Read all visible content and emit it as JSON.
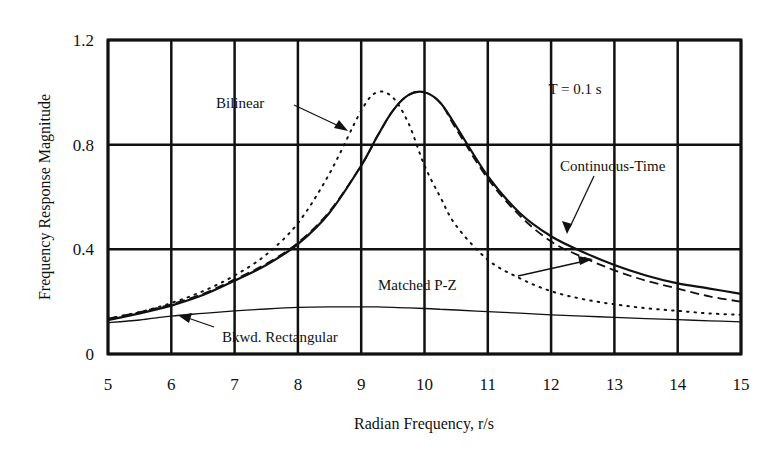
{
  "chart_data": {
    "type": "line",
    "title": "",
    "xlabel": "Radian Frequency, r/s",
    "ylabel": "Frequency Response Magnitude",
    "xlim": [
      5,
      15
    ],
    "ylim": [
      0,
      1.2
    ],
    "xticks": [
      "5",
      "6",
      "7",
      "8",
      "9",
      "10",
      "11",
      "12",
      "13",
      "14",
      "15"
    ],
    "yticks": [
      "0",
      "0.4",
      "0.8",
      "1.2"
    ],
    "grid": true,
    "legend": "annotations with arrows",
    "annotation_text": "T = 0.1 s",
    "x": [
      5,
      5.5,
      6,
      6.5,
      7,
      7.5,
      8,
      8.5,
      9,
      9.25,
      9.5,
      9.75,
      10,
      10.25,
      10.5,
      11,
      11.5,
      12,
      12.5,
      13,
      13.5,
      14,
      14.5,
      15
    ],
    "series": [
      {
        "name": "Continuous-Time",
        "style": "solid-thick",
        "values": [
          0.13,
          0.155,
          0.185,
          0.225,
          0.28,
          0.34,
          0.42,
          0.54,
          0.72,
          0.83,
          0.93,
          0.99,
          1.0,
          0.96,
          0.87,
          0.68,
          0.54,
          0.45,
          0.39,
          0.34,
          0.3,
          0.27,
          0.25,
          0.23
        ]
      },
      {
        "name": "Matched P-Z",
        "style": "dashed",
        "values": [
          0.135,
          0.16,
          0.19,
          0.23,
          0.285,
          0.345,
          0.425,
          0.545,
          0.72,
          0.83,
          0.93,
          0.99,
          1.0,
          0.96,
          0.86,
          0.67,
          0.53,
          0.43,
          0.37,
          0.32,
          0.28,
          0.25,
          0.22,
          0.2
        ]
      },
      {
        "name": "Bilinear",
        "style": "dotted",
        "values": [
          0.135,
          0.16,
          0.195,
          0.24,
          0.3,
          0.38,
          0.5,
          0.69,
          0.93,
          1.0,
          0.98,
          0.88,
          0.72,
          0.6,
          0.49,
          0.36,
          0.29,
          0.24,
          0.21,
          0.19,
          0.175,
          0.165,
          0.155,
          0.15
        ]
      },
      {
        "name": "Bkwd. Rectangular",
        "style": "solid-thin",
        "values": [
          0.12,
          0.13,
          0.145,
          0.155,
          0.165,
          0.172,
          0.178,
          0.18,
          0.18,
          0.18,
          0.178,
          0.176,
          0.174,
          0.171,
          0.168,
          0.162,
          0.156,
          0.15,
          0.145,
          0.14,
          0.135,
          0.131,
          0.127,
          0.123
        ]
      }
    ],
    "labels": {
      "bilinear": "Bilinear",
      "continuous": "Continuous-Time",
      "matched": "Matched P-Z",
      "bkwd": "Bkwd. Rectangular"
    }
  }
}
